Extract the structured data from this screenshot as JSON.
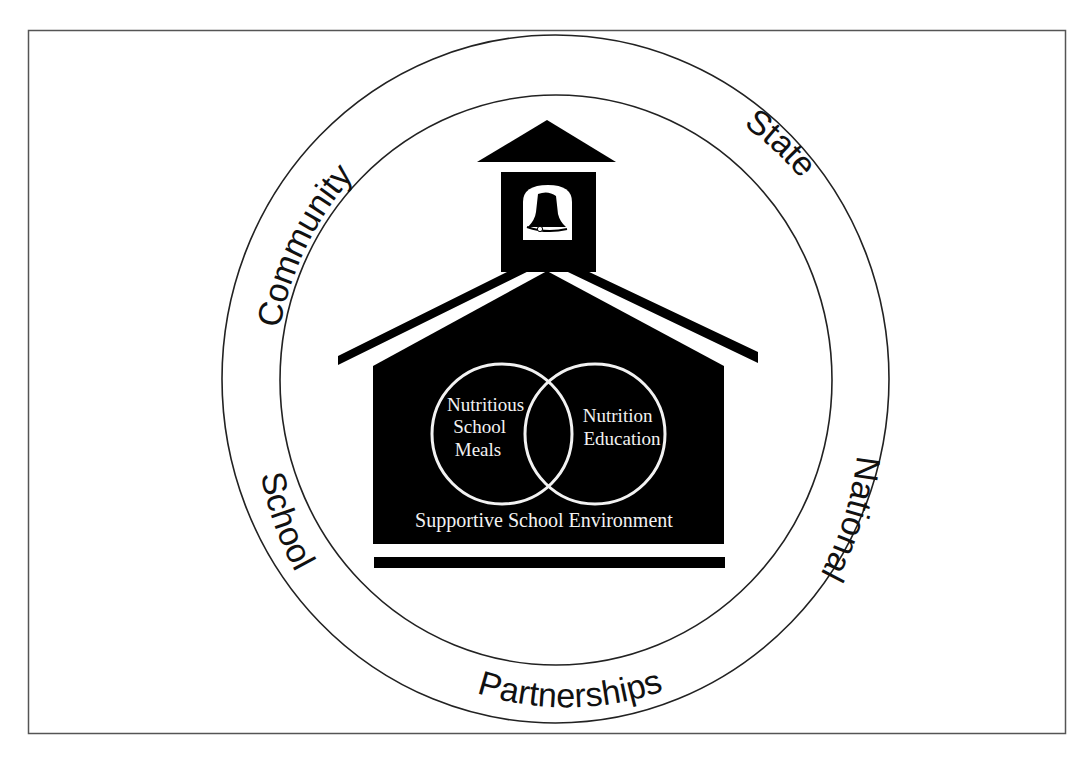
{
  "diagram": {
    "outer_ring": {
      "labels": {
        "community": "Community",
        "state": "State",
        "national": "National",
        "partnerships": "Partnerships",
        "school": "School"
      }
    },
    "schoolhouse": {
      "venn": {
        "left": [
          "Nutritious",
          "School",
          "Meals"
        ],
        "right": [
          "Nutrition",
          "Education"
        ]
      },
      "environment_label": "Supportive School Environment",
      "icons": {
        "bell": "bell-icon"
      }
    },
    "colors": {
      "background": "#ffffff",
      "frame": "#555555",
      "ring_stroke": "#222222",
      "house_fill": "#000000",
      "inner_text": "#f2f2f2",
      "ring_text": "#111111"
    }
  }
}
